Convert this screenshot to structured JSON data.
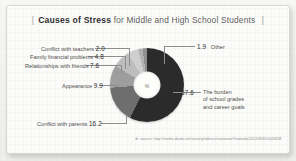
{
  "card": {
    "title": {
      "bracket_left": "|",
      "strong": "Causes of Stress",
      "rest": "for Middle and High School Students",
      "bracket_right": "|"
    },
    "center_symbol": "%",
    "source": {
      "marker": "※",
      "text": "source: http://media.daum.net/society/others/newsview?newsid=20120830100482M"
    }
  },
  "chart_data": {
    "type": "pie",
    "title": "Causes of Stress for Middle and High School Students",
    "unit": "%",
    "donut": true,
    "legend_position": "callout-labels",
    "categories": [
      "The burden of school grades and career goals",
      "Conflict with parents",
      "Appearance",
      "Relationships with friends",
      "Family financial problems",
      "Conflict with teachers",
      "Other"
    ],
    "values": [
      57.6,
      16.2,
      9.9,
      7.6,
      4.8,
      2.0,
      1.9
    ],
    "colors": [
      "#2b2b2b",
      "#6e6e6e",
      "#9e9e9e",
      "#bdbdbd",
      "#cfcfcf",
      "#b3b3b3",
      "#8f8f8f"
    ],
    "slices": [
      {
        "label": "The burden of school grades and career goals",
        "value": 57.6,
        "value_text": "57.6",
        "color": "#2b2b2b"
      },
      {
        "label": "Conflict with parents",
        "value": 16.2,
        "value_text": "16.2",
        "color": "#6e6e6e"
      },
      {
        "label": "Appearance",
        "value": 9.9,
        "value_text": "9.9",
        "color": "#9e9e9e"
      },
      {
        "label": "Relationships with friends",
        "value": 7.6,
        "value_text": "7.6",
        "color": "#bdbdbd"
      },
      {
        "label": "Family financial problems",
        "value": 4.8,
        "value_text": "4.8",
        "color": "#cfcfcf"
      },
      {
        "label": "Conflict with teachers",
        "value": 2.0,
        "value_text": "2.0",
        "color": "#b3b3b3"
      },
      {
        "label": "Other",
        "value": 1.9,
        "value_text": "1.9",
        "color": "#8f8f8f"
      }
    ],
    "labels": {
      "teachers": {
        "text": "Conflict with teachers",
        "value": "2.0"
      },
      "family": {
        "text": "Family financial problems",
        "value": "4.8"
      },
      "friends": {
        "text": "Relationships with friends",
        "value": "7.6"
      },
      "appearance": {
        "text": "Appearance",
        "value": "9.9"
      },
      "parents": {
        "text": "Conflict with parents",
        "value": "16.2"
      },
      "other": {
        "text": "Other",
        "value": "1.9"
      },
      "burden": {
        "text": "The burden of school grades and career goals",
        "value": "57.6",
        "line1": "The burden",
        "line2": "of school grades",
        "line3": "and career goals"
      }
    }
  }
}
